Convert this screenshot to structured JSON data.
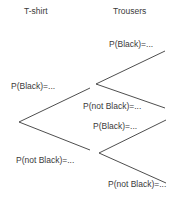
{
  "headers": {
    "tshirt": "T-shirt",
    "trousers": "Trousers"
  },
  "tshirt_branches": {
    "black": "P(Black)=...",
    "not_black": "P(not Black)=..."
  },
  "trousers_upper": {
    "black": "P(Black)=...",
    "not_black": "P(not Black)=..."
  },
  "trousers_lower": {
    "black": "P(Black)=...",
    "not_black": "P(not Black)=..."
  },
  "line_color": "#3a3a3a"
}
